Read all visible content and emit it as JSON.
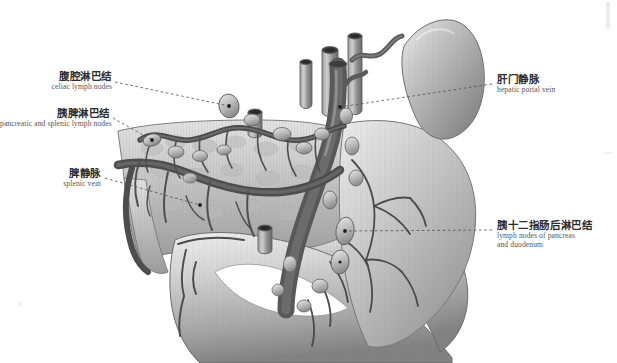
{
  "figure": {
    "type": "anatomical-illustration",
    "style": "grayscale medical atlas plate",
    "background_color": "#ffffff",
    "ink_color": "#3a3a3a"
  },
  "labels": [
    {
      "id": "celiac-lymph-nodes",
      "cn": "腹腔淋巴结",
      "en": "celiac lymph nodes",
      "side": "left",
      "anchor": "celiac node cluster above pancreas neck"
    },
    {
      "id": "pancreatic-splenic-lymph-nodes",
      "cn": "胰脾淋巴结",
      "en": "pancreatic and splenic lymph nodes",
      "side": "left",
      "anchor": "node chain along superior border of pancreas body"
    },
    {
      "id": "splenic-vein",
      "cn": "脾静脉",
      "en": "splenic vein",
      "side": "left",
      "anchor": "splenic vein crossing posterior pancreas"
    },
    {
      "id": "hepatic-portal-vein",
      "cn": "肝门静脉",
      "en": "hepatic portal vein",
      "side": "right",
      "anchor": "portal vein trunk ascending behind pancreas neck"
    },
    {
      "id": "lymph-nodes-pancreas-duodenum",
      "cn": "胰十二指肠后淋巴结",
      "en": "lymph nodes of pancreas\nand duodenum",
      "en_line1": "lymph nodes of pancreas",
      "en_line2": "and duodenum",
      "side": "right",
      "anchor": "posterior pancreaticoduodenal node chain"
    }
  ],
  "structures": [
    {
      "name": "spleen",
      "note": "upper right, bean shaped organ"
    },
    {
      "name": "pancreas",
      "note": "central body and tail, lobulated"
    },
    {
      "name": "duodenum",
      "note": "C-shaped loop, lower right"
    },
    {
      "name": "portal-vein",
      "note": "large ascending trunk"
    },
    {
      "name": "splenic-vein",
      "note": "horizontal vessel across pancreas"
    },
    {
      "name": "splenic-artery",
      "note": "tortuous vessel along superior pancreas"
    },
    {
      "name": "celiac-trunk",
      "note": "cut vessel stumps superiorly"
    },
    {
      "name": "lymph-node-chain",
      "note": "ovoid nodes along vessels"
    },
    {
      "name": "bile-duct",
      "note": "cut duct stump"
    }
  ],
  "leaders": [
    {
      "from": "celiac-lymph-nodes",
      "to_point": [
        229,
        106
      ]
    },
    {
      "from": "pancreatic-splenic-lymph-nodes",
      "to_point": [
        152,
        140
      ]
    },
    {
      "from": "splenic-vein",
      "to_point": [
        200,
        205
      ]
    },
    {
      "from": "hepatic-portal-vein",
      "to_point": [
        340,
        107
      ]
    },
    {
      "from": "lymph-nodes-pancreas-duodenum",
      "to_point": [
        345,
        231
      ]
    }
  ],
  "colors": {
    "vessel_dark": "#4a4a4a",
    "vessel_mid": "#6f6f6f",
    "organ_light": "#d8d8d8",
    "organ_mid": "#b4b4b4",
    "organ_shadow": "#8a8a8a",
    "leader": "#555555",
    "text": "#2e2e2e"
  }
}
